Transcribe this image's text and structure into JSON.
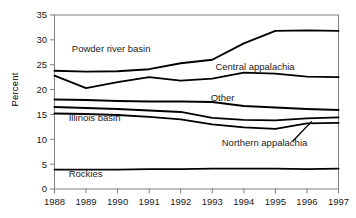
{
  "chart_data": {
    "type": "line",
    "title": "",
    "xlabel": "",
    "ylabel": "Percent",
    "x": [
      1988,
      1989,
      1990,
      1991,
      1992,
      1993,
      1994,
      1995,
      1996,
      1997
    ],
    "xtick_labels": [
      "1988",
      "1989",
      "1990",
      "1991",
      "1992",
      "1993",
      "1994",
      "1995",
      "1996",
      "1997"
    ],
    "ytick_labels": [
      "0",
      "5",
      "10",
      "15",
      "20",
      "25",
      "30",
      "35"
    ],
    "yticks": [
      0,
      5,
      10,
      15,
      20,
      25,
      30,
      35
    ],
    "ylim": [
      0,
      35
    ],
    "xlim": [
      1988,
      1997
    ],
    "grid": false,
    "legend_position": "inline-annotations",
    "series": [
      {
        "name": "Powder river basin",
        "label_x": 1988.55,
        "label_y": 27.6,
        "values": [
          23.8,
          23.6,
          23.7,
          24.1,
          25.3,
          26.0,
          29.3,
          31.8,
          31.9,
          31.8
        ]
      },
      {
        "name": "Central appalachia",
        "label_x": 1993.1,
        "label_y": 24.0,
        "values": [
          22.8,
          20.3,
          21.5,
          22.5,
          21.8,
          22.2,
          23.4,
          23.2,
          22.6,
          22.5
        ]
      },
      {
        "name": "Other",
        "label_x": 1992.95,
        "label_y": 17.7,
        "values": [
          18.0,
          17.9,
          17.7,
          17.6,
          17.6,
          17.5,
          16.7,
          16.4,
          16.1,
          15.9
        ]
      },
      {
        "name": "Illinois basin",
        "label_x": 1988.45,
        "label_y": 13.6,
        "values": [
          16.5,
          16.3,
          16.1,
          15.8,
          15.5,
          14.3,
          13.9,
          13.8,
          14.2,
          14.4
        ]
      },
      {
        "name": "Northern appalachia",
        "label_x": 1993.3,
        "label_y": 8.6,
        "values": [
          15.2,
          15.1,
          14.9,
          14.5,
          14.0,
          13.0,
          12.4,
          12.1,
          13.2,
          13.3
        ],
        "leader_from": [
          1995.55,
          9.6
        ],
        "leader_to": [
          1996.15,
          13.6
        ]
      },
      {
        "name": "Rockies",
        "label_x": 1988.45,
        "label_y": 2.5,
        "values": [
          3.9,
          3.9,
          3.9,
          4.0,
          4.0,
          4.1,
          4.1,
          4.1,
          4.0,
          4.1
        ]
      }
    ]
  },
  "colors": {
    "line": "#000000",
    "axis": "#808080",
    "text": "#1a1a1a",
    "background": "#ffffff"
  }
}
